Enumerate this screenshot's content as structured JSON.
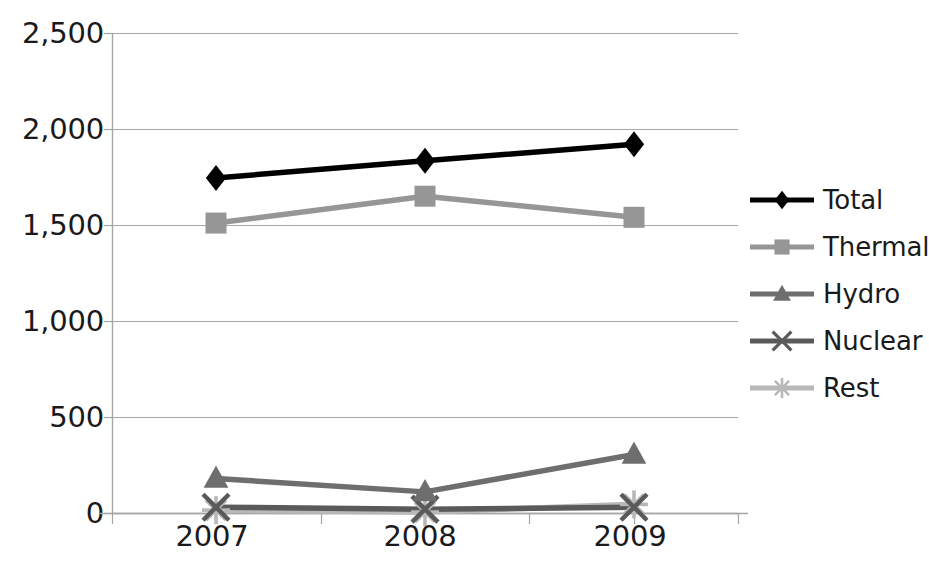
{
  "chart_data": {
    "type": "line",
    "title": "",
    "xlabel": "",
    "ylabel": "",
    "categories": [
      "2007",
      "2008",
      "2009"
    ],
    "x": [
      2007,
      2008,
      2009
    ],
    "ylim": [
      0,
      2500
    ],
    "y_ticks": [
      0,
      500,
      1000,
      1500,
      2000,
      2500
    ],
    "y_tick_labels": [
      "0",
      "500",
      "1,000",
      "1,500",
      "2,000",
      "2,500"
    ],
    "x_tick_labels": [
      "2007",
      "2008",
      "2009"
    ],
    "grid": "horizontal",
    "legend_position": "right",
    "series": [
      {
        "name": "Total",
        "marker": "diamond",
        "color": "#000000",
        "values": [
          1745,
          1835,
          1920
        ]
      },
      {
        "name": "Thermal",
        "marker": "square",
        "color": "#969696",
        "values": [
          1510,
          1650,
          1540
        ]
      },
      {
        "name": "Hydro",
        "marker": "triangle",
        "color": "#6e6e6e",
        "values": [
          180,
          110,
          305
        ]
      },
      {
        "name": "Nuclear",
        "marker": "x-cross",
        "color": "#5a5a5a",
        "values": [
          30,
          20,
          30
        ]
      },
      {
        "name": "Rest",
        "marker": "asterisk",
        "color": "#b8b8b8",
        "values": [
          15,
          5,
          45
        ]
      }
    ]
  },
  "legend": {
    "items": [
      {
        "label": "Total",
        "icon": "diamond-marker-icon"
      },
      {
        "label": "Thermal",
        "icon": "square-marker-icon"
      },
      {
        "label": "Hydro",
        "icon": "triangle-marker-icon"
      },
      {
        "label": "Nuclear",
        "icon": "x-marker-icon"
      },
      {
        "label": "Rest",
        "icon": "asterisk-marker-icon"
      }
    ]
  },
  "axes": {
    "y_tick_labels": [
      "2,500",
      "2,000",
      "1,500",
      "1,000",
      "500",
      "0"
    ],
    "x_tick_labels": [
      "2007",
      "2008",
      "2009"
    ]
  }
}
